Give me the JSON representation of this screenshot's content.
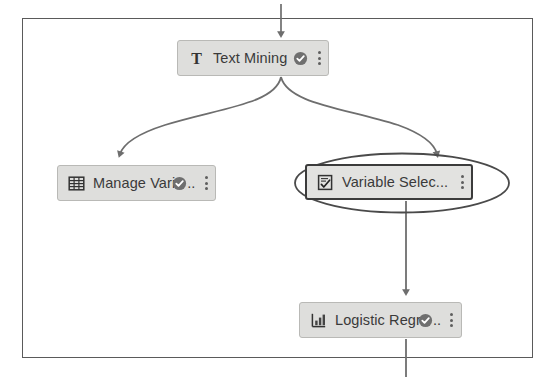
{
  "canvas": {
    "name": "pipeline-canvas"
  },
  "nodes": [
    {
      "id": "text-mining",
      "label": "Text Mining",
      "icon": "text-t-icon",
      "status": "check-badge-icon",
      "status_label": "complete",
      "truncated": false,
      "ellipsis": "",
      "menu": "node-menu-icon",
      "selected": false
    },
    {
      "id": "manage-variables",
      "label": "Manage Vari",
      "icon": "table-grid-icon",
      "status": "check-badge-icon",
      "status_label": "complete",
      "truncated": true,
      "ellipsis": "..",
      "menu": "node-menu-icon",
      "selected": false
    },
    {
      "id": "variable-selection",
      "label": "Variable Selec...",
      "icon": "document-check-icon",
      "status": "",
      "status_label": "",
      "truncated": true,
      "ellipsis": "",
      "menu": "node-menu-icon",
      "selected": true
    },
    {
      "id": "logistic-regression",
      "label": "Logistic Regr",
      "icon": "bar-chart-icon",
      "status": "check-badge-icon",
      "status_label": "complete",
      "truncated": true,
      "ellipsis": "..",
      "menu": "node-menu-icon",
      "selected": false
    }
  ],
  "connections": [
    {
      "id": "inflow-to-text-mining",
      "from": "above-canvas",
      "to": "text-mining",
      "style": "straight"
    },
    {
      "id": "text-mining-to-manage-variables",
      "from": "text-mining",
      "to": "manage-variables",
      "style": "curved"
    },
    {
      "id": "text-mining-to-variable-selection",
      "from": "text-mining",
      "to": "variable-selection",
      "style": "curved"
    },
    {
      "id": "variable-selection-to-logistic-regression",
      "from": "variable-selection",
      "to": "logistic-regression",
      "style": "straight"
    },
    {
      "id": "logistic-regression-outflow",
      "from": "logistic-regression",
      "to": "below-canvas",
      "style": "straight"
    }
  ],
  "colors": {
    "node_fill": "#dededc",
    "node_border": "#b9b9b6",
    "node_selected_border": "#3b3b3b",
    "canvas_border": "#5a5a5a",
    "connector": "#6e6e6e",
    "label_text": "#3a3a3a",
    "badge": "#6f6f6f",
    "background": "#ffffff"
  }
}
